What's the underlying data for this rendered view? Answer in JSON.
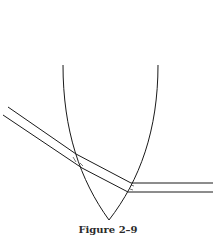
{
  "figure": {
    "caption": "Figure 2–9",
    "stroke_color": "#1a1a1a",
    "background": "#ffffff"
  }
}
